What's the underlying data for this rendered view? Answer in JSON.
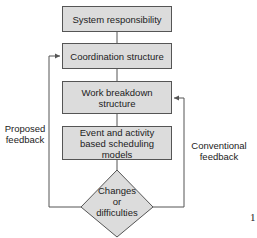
{
  "diagram": {
    "boxes": [
      {
        "label": "System responsibility"
      },
      {
        "label": "Coordination structure"
      },
      {
        "label": "Work breakdown structure"
      },
      {
        "label": "Event and activity based scheduling models"
      }
    ],
    "decision": {
      "line1": "Changes",
      "line2": "or",
      "line3": "difficulties"
    },
    "left_feedback": {
      "line1": "Proposed",
      "line2": "feedback"
    },
    "right_feedback": {
      "line1": "Conventional",
      "line2": "feedback"
    },
    "page_marker": "1",
    "colors": {
      "box_fill": "#dcdcdc",
      "stroke": "#555555"
    }
  }
}
